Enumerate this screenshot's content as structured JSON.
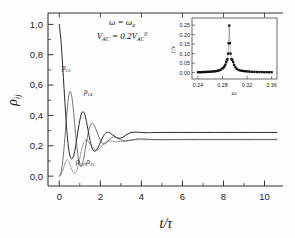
{
  "figure": {
    "background_color": "#fefefe",
    "axis_color": "#333333",
    "curve_solid_color": "#1a1a1a",
    "curve_dashed_color": "#555555"
  },
  "main_axes": {
    "ylabel": "ρ",
    "ylabel_sub": "ij",
    "xlabel": "t/τ",
    "y_ticks": [
      "0,0",
      "0,2",
      "0,4",
      "0,6",
      "0,8",
      "1,0"
    ],
    "y_values": [
      0.0,
      0.2,
      0.4,
      0.6,
      0.8,
      1.0
    ],
    "x_ticks": [
      "0",
      "2",
      "4",
      "6",
      "8",
      "10"
    ],
    "x_values": [
      0,
      2,
      4,
      6,
      8,
      10
    ],
    "xlim": [
      -0.55,
      10.9
    ],
    "ylim": [
      -0.065,
      1.075
    ],
    "grid": false
  },
  "annotations": {
    "line1_prefix": "ω = ω",
    "line1_sub": "a",
    "line2_v": "V",
    "line2_v_sub": "AC",
    "line2_eq": " = 0.2V",
    "line2_v2_sub": "AC",
    "line2_v2_sup": "0",
    "curve_label_1": "ρ",
    "curve_label_1_sub": "12",
    "curve_label_2": "ρ",
    "curve_label_2_sub": "14",
    "curve_label_3_a": "ρ",
    "curve_label_3_a_sub": "13",
    "curve_label_3_sep": ",",
    "curve_label_3_b": "ρ",
    "curve_label_3_b_sub": "15"
  },
  "inset_axes": {
    "ylabel": "1/τ",
    "xlabel": "ω",
    "y_ticks": [
      "0.00",
      "0.05",
      "0.10",
      "0.15",
      "0.20",
      "0.25"
    ],
    "y_values": [
      0.0,
      0.05,
      0.1,
      0.15,
      0.2,
      0.25
    ],
    "x_ticks": [
      "0.24",
      "0.28",
      "0.32",
      "0.36"
    ],
    "x_values": [
      0.24,
      0.28,
      0.32,
      0.36
    ],
    "xlim": [
      0.2335,
      0.3655
    ],
    "ylim": [
      -0.018,
      0.272
    ],
    "grid": false
  },
  "chart_data": [
    {
      "type": "line",
      "id": "main-relaxation-plot",
      "title": "",
      "xlabel": "t/τ",
      "ylabel": "ρ_ij",
      "xlim": [
        -0.55,
        10.9
      ],
      "ylim": [
        -0.065,
        1.075
      ],
      "grid": false,
      "legend": "inline-curve-labels",
      "annotations": [
        "ω = ω_a",
        "V_AC = 0.2V_AC^0"
      ],
      "series": [
        {
          "name": "ρ_12",
          "style": "solid",
          "color": "#1a1a1a",
          "x": [
            0.0,
            0.05,
            0.1,
            0.15,
            0.2,
            0.25,
            0.3,
            0.35,
            0.4,
            0.45,
            0.5,
            0.55,
            0.6,
            0.65,
            0.7,
            0.75,
            0.8,
            0.85,
            0.9,
            0.95,
            1.0,
            1.05,
            1.1,
            1.15,
            1.2,
            1.25,
            1.3,
            1.35,
            1.4,
            1.45,
            1.5,
            1.6,
            1.7,
            1.8,
            1.9,
            2.0,
            2.1,
            2.2,
            2.3,
            2.4,
            2.5,
            2.6,
            2.7,
            2.8,
            2.9,
            3.0,
            3.1,
            3.2,
            3.3,
            3.4,
            3.5,
            3.7,
            3.9,
            4.1,
            4.3,
            4.5,
            5.0,
            5.5,
            6.0,
            6.5,
            7.0,
            7.5,
            8.0,
            9.0,
            10.0,
            10.6
          ],
          "y": [
            1.0,
            0.94,
            0.86,
            0.76,
            0.65,
            0.54,
            0.43,
            0.33,
            0.25,
            0.185,
            0.145,
            0.122,
            0.113,
            0.118,
            0.135,
            0.162,
            0.2,
            0.243,
            0.288,
            0.33,
            0.368,
            0.398,
            0.418,
            0.425,
            0.42,
            0.403,
            0.376,
            0.342,
            0.305,
            0.268,
            0.235,
            0.185,
            0.165,
            0.17,
            0.192,
            0.222,
            0.252,
            0.274,
            0.286,
            0.288,
            0.282,
            0.272,
            0.262,
            0.254,
            0.25,
            0.251,
            0.257,
            0.266,
            0.275,
            0.282,
            0.287,
            0.29,
            0.289,
            0.287,
            0.286,
            0.287,
            0.288,
            0.288,
            0.288,
            0.288,
            0.288,
            0.288,
            0.288,
            0.288,
            0.288,
            0.288
          ]
        },
        {
          "name": "ρ_14",
          "style": "solid-thin",
          "color": "#3a3a3a",
          "x": [
            0.0,
            0.05,
            0.1,
            0.15,
            0.2,
            0.25,
            0.3,
            0.35,
            0.4,
            0.45,
            0.5,
            0.55,
            0.6,
            0.65,
            0.7,
            0.75,
            0.8,
            0.85,
            0.9,
            0.95,
            1.0,
            1.05,
            1.1,
            1.15,
            1.2,
            1.3,
            1.4,
            1.5,
            1.6,
            1.7,
            1.8,
            1.9,
            2.0,
            2.1,
            2.2,
            2.3,
            2.4,
            2.5,
            2.6,
            2.7,
            2.8,
            2.9,
            3.0,
            3.2,
            3.4,
            3.6,
            3.8,
            4.0,
            4.5,
            5.0,
            5.5,
            6.0,
            7.0,
            8.0,
            9.0,
            10.0,
            10.6
          ],
          "y": [
            0.0,
            0.01,
            0.035,
            0.078,
            0.14,
            0.215,
            0.3,
            0.385,
            0.46,
            0.52,
            0.552,
            0.555,
            0.53,
            0.482,
            0.418,
            0.345,
            0.272,
            0.203,
            0.145,
            0.1,
            0.072,
            0.062,
            0.07,
            0.092,
            0.125,
            0.205,
            0.28,
            0.33,
            0.348,
            0.336,
            0.305,
            0.268,
            0.236,
            0.216,
            0.212,
            0.22,
            0.234,
            0.248,
            0.256,
            0.258,
            0.253,
            0.246,
            0.239,
            0.232,
            0.234,
            0.24,
            0.245,
            0.246,
            0.242,
            0.24,
            0.241,
            0.242,
            0.242,
            0.242,
            0.242,
            0.242,
            0.242
          ]
        },
        {
          "name": "ρ_13,ρ_15",
          "style": "dotted",
          "color": "#555555",
          "x": [
            0.0,
            0.05,
            0.1,
            0.15,
            0.2,
            0.25,
            0.3,
            0.35,
            0.4,
            0.45,
            0.5,
            0.55,
            0.6,
            0.65,
            0.7,
            0.75,
            0.8,
            0.85,
            0.9,
            0.95,
            1.0,
            1.05,
            1.1,
            1.2,
            1.3,
            1.4,
            1.5,
            1.6,
            1.7,
            1.8,
            1.9,
            2.0,
            2.1,
            2.2,
            2.3,
            2.4,
            2.5,
            2.6,
            2.7,
            2.8,
            3.0,
            3.2,
            3.4,
            3.6,
            3.8,
            4.0,
            4.5,
            5.0,
            6.0,
            7.0,
            8.0,
            9.0,
            10.0,
            10.6
          ],
          "y": [
            0.0,
            0.004,
            0.014,
            0.03,
            0.05,
            0.072,
            0.092,
            0.104,
            0.108,
            0.1,
            0.086,
            0.066,
            0.046,
            0.03,
            0.02,
            0.017,
            0.022,
            0.036,
            0.058,
            0.086,
            0.118,
            0.15,
            0.18,
            0.222,
            0.238,
            0.232,
            0.212,
            0.19,
            0.174,
            0.168,
            0.174,
            0.188,
            0.204,
            0.218,
            0.228,
            0.232,
            0.232,
            0.23,
            0.228,
            0.226,
            0.228,
            0.232,
            0.236,
            0.239,
            0.24,
            0.24,
            0.24,
            0.24,
            0.24,
            0.24,
            0.24,
            0.24,
            0.24,
            0.24
          ]
        }
      ]
    },
    {
      "type": "scatter",
      "id": "inset-resonance-peak",
      "title": "",
      "xlabel": "ω",
      "ylabel": "1/τ",
      "xlim": [
        0.2335,
        0.3655
      ],
      "ylim": [
        -0.018,
        0.272
      ],
      "grid": false,
      "marker": "square",
      "color": "#111111",
      "x": [
        0.24,
        0.2425,
        0.245,
        0.2475,
        0.25,
        0.2525,
        0.255,
        0.2575,
        0.26,
        0.2625,
        0.265,
        0.2675,
        0.27,
        0.2725,
        0.275,
        0.2775,
        0.28,
        0.2815,
        0.283,
        0.2845,
        0.286,
        0.287,
        0.288,
        0.289,
        0.29,
        0.291,
        0.292,
        0.293,
        0.2945,
        0.296,
        0.2975,
        0.299,
        0.301,
        0.303,
        0.306,
        0.309,
        0.312,
        0.315,
        0.318,
        0.321,
        0.324,
        0.328,
        0.332,
        0.336,
        0.34,
        0.344,
        0.348,
        0.352,
        0.356,
        0.36
      ],
      "y": [
        0.002,
        0.002,
        0.002,
        0.003,
        0.003,
        0.003,
        0.004,
        0.004,
        0.005,
        0.005,
        0.006,
        0.007,
        0.008,
        0.01,
        0.012,
        0.016,
        0.022,
        0.026,
        0.032,
        0.041,
        0.055,
        0.068,
        0.07,
        0.1,
        0.155,
        0.248,
        0.155,
        0.1,
        0.07,
        0.068,
        0.055,
        0.04,
        0.028,
        0.02,
        0.014,
        0.011,
        0.009,
        0.008,
        0.007,
        0.006,
        0.005,
        0.004,
        0.004,
        0.003,
        0.003,
        0.003,
        0.002,
        0.002,
        0.002,
        0.002
      ]
    }
  ]
}
